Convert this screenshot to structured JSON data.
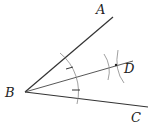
{
  "diagram": {
    "labels": {
      "A": "A",
      "B": "B",
      "C": "C",
      "D": "D"
    },
    "points": {
      "B": [
        25,
        92
      ],
      "A_end": [
        113,
        17
      ],
      "C_end": [
        148,
        107
      ],
      "D_ray_end": [
        133,
        61
      ],
      "D": [
        116,
        65
      ]
    },
    "colors": {
      "line": "#333333",
      "arc": "#777777"
    }
  }
}
